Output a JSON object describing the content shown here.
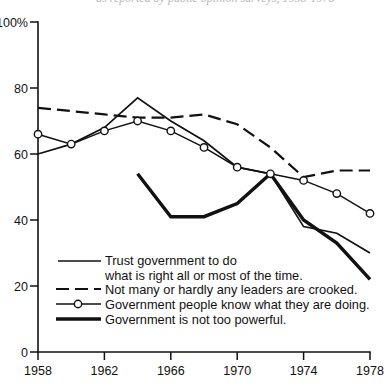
{
  "figure": {
    "background_color": "#ffffff",
    "ink_color": "#111111",
    "top_cropped_caption": "as reported by public opinion surveys, 1958-1978"
  },
  "chart_data": {
    "type": "line",
    "title": "",
    "subtitle": "",
    "xlabel": "",
    "ylabel": "",
    "xlim": [
      1958,
      1978
    ],
    "ylim": [
      0,
      100
    ],
    "grid": false,
    "legend_position": "inside-bottom-left",
    "y_axis": {
      "ticks": [
        0,
        20,
        40,
        60,
        80,
        100
      ],
      "tick_labels": [
        "0",
        "20",
        "40",
        "60",
        "80",
        "100%"
      ],
      "unit": "%"
    },
    "x_axis": {
      "ticks": [
        1958,
        1962,
        1966,
        1970,
        1974,
        1978
      ],
      "tick_labels": [
        "1958",
        "1962",
        "1966",
        "1970",
        "1974",
        "1978"
      ],
      "minor_interval": 2
    },
    "series": [
      {
        "name": "Trust government to do what is right all or most of the time.",
        "legend_label_line1": "Trust government to do",
        "legend_label_line2": "what is right all or most of the time.",
        "style": "solid",
        "markers": "none",
        "x": [
          1958,
          1960,
          1962,
          1964,
          1966,
          1968,
          1970,
          1972,
          1974,
          1976,
          1978
        ],
        "values": [
          60,
          63,
          68,
          77,
          70,
          64,
          56,
          54,
          38,
          36,
          30
        ]
      },
      {
        "name": "Not many or hardly any leaders are crooked.",
        "legend_label_line1": "Not many or hardly any leaders are crooked.",
        "legend_label_line2": "",
        "style": "dashed",
        "markers": "none",
        "x": [
          1958,
          1960,
          1962,
          1964,
          1966,
          1968,
          1970,
          1972,
          1974,
          1976,
          1978
        ],
        "values": [
          74,
          73,
          72,
          71,
          71,
          72,
          69,
          62,
          53,
          55,
          55
        ]
      },
      {
        "name": "Government people know what they are doing.",
        "legend_label_line1": "Government people know what they are doing.",
        "legend_label_line2": "",
        "style": "solid-with-circles",
        "markers": "open-circle",
        "x": [
          1958,
          1960,
          1962,
          1964,
          1966,
          1968,
          1970,
          1972,
          1974,
          1976,
          1978
        ],
        "values": [
          66,
          63,
          67,
          70,
          67,
          62,
          56,
          54,
          52,
          48,
          42
        ]
      },
      {
        "name": "Government is not too powerful.",
        "legend_label_line1": "Government is not too powerful.",
        "legend_label_line2": "",
        "style": "thick-solid",
        "markers": "none",
        "x": [
          1964,
          1966,
          1968,
          1970,
          1972,
          1974,
          1976,
          1978
        ],
        "values": [
          54,
          41,
          41,
          45,
          54,
          40,
          33,
          22
        ]
      }
    ]
  },
  "legend": {
    "entries": [
      {
        "id": "trust",
        "sample": "solid-line-sample",
        "line1": "Trust government to do",
        "line2": "what is right all or most of the time."
      },
      {
        "id": "crooked",
        "sample": "dashed-line-sample",
        "line1": "Not many or hardly any leaders are crooked.",
        "line2": ""
      },
      {
        "id": "know",
        "sample": "circle-line-sample",
        "line1": "Government people know what they are doing.",
        "line2": ""
      },
      {
        "id": "powerful",
        "sample": "thick-line-sample",
        "line1": "Government is not too powerful.",
        "line2": ""
      }
    ]
  }
}
